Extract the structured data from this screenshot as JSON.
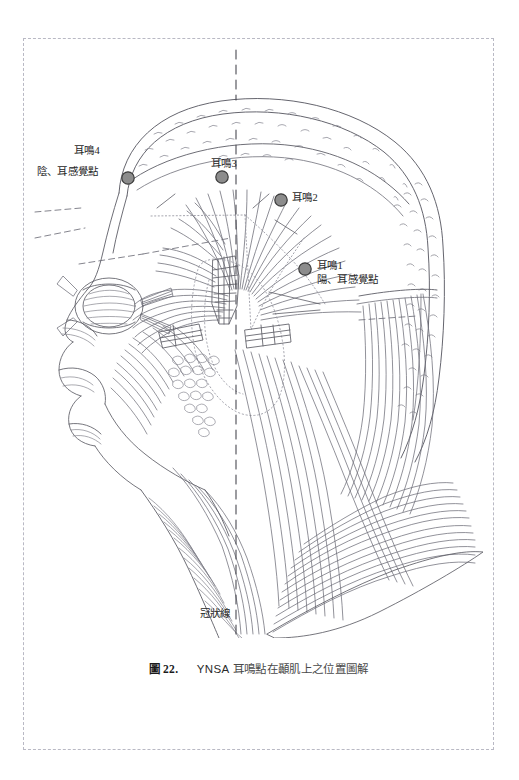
{
  "figure": {
    "number_prefix": "圖",
    "number": "22.",
    "system": "YNSA",
    "caption_text": "耳鳴點在顳肌上之位置圖解",
    "caption_full": "圖 22.   YNSA 耳鳴點在顳肌上之位置圖解",
    "frame_style": "dashed",
    "colors": {
      "marker_fill": "#8c8c8c",
      "marker_stroke": "#3b3b3b",
      "line_ink": "#6e6e78",
      "ink_dark": "#4a4a52",
      "frame": "#b9b9c4",
      "text": "#262626",
      "background": "#ffffff"
    }
  },
  "labels": {
    "tinnitus_4": "耳鳴4",
    "tinnitus_4_sub": "陰、耳感覺點",
    "tinnitus_3": "耳鳴3",
    "tinnitus_2": "耳鳴2",
    "tinnitus_1": "耳鳴1",
    "tinnitus_1_sub": "陽、耳感覺點",
    "coronal_line": "冠狀線"
  },
  "points": [
    {
      "name": "tinnitus-point-4",
      "label": "耳鳴4",
      "sub_label": "陰、耳感覺點",
      "x": 128,
      "y": 178
    },
    {
      "name": "tinnitus-point-3",
      "label": "耳鳴3",
      "sub_label": "",
      "x": 222,
      "y": 177
    },
    {
      "name": "tinnitus-point-2",
      "label": "耳鳴2",
      "sub_label": "",
      "x": 281,
      "y": 200
    },
    {
      "name": "tinnitus-point-1",
      "label": "耳鳴1",
      "sub_label": "陽、耳感覺點",
      "x": 305,
      "y": 269
    }
  ],
  "guides": {
    "midsagittal": "vertical dashed center line",
    "coronal": "冠狀線"
  }
}
